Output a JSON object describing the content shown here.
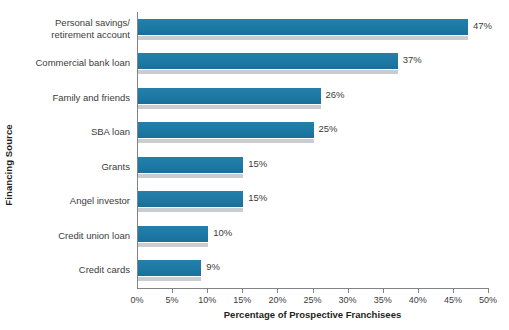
{
  "chart_data": {
    "type": "bar",
    "orientation": "horizontal",
    "title": "",
    "xlabel": "Percentage of Prospective Franchisees",
    "ylabel": "Financing Source",
    "xlim": [
      0,
      50
    ],
    "xtick_labels": [
      "0%",
      "5%",
      "10%",
      "15%",
      "20%",
      "25%",
      "30%",
      "35%",
      "40%",
      "45%",
      "50%"
    ],
    "xtick_values": [
      0,
      5,
      10,
      15,
      20,
      25,
      30,
      35,
      40,
      45,
      50
    ],
    "grid": false,
    "legend": "none",
    "categories": [
      "Personal savings/\nretirement account",
      "Commercial bank loan",
      "Family and friends",
      "SBA loan",
      "Grants",
      "Angel investor",
      "Credit union loan",
      "Credit cards"
    ],
    "values": [
      47,
      37,
      26,
      25,
      15,
      15,
      10,
      9
    ],
    "value_labels": [
      "47%",
      "37%",
      "26%",
      "25%",
      "15%",
      "15%",
      "10%",
      "9%"
    ],
    "bar_color": "#1d7ba6",
    "bar_shadow_color": "#c9cdd0",
    "axis_color": "#808487",
    "text_color": "#3c3c3c",
    "background": "#ffffff"
  }
}
